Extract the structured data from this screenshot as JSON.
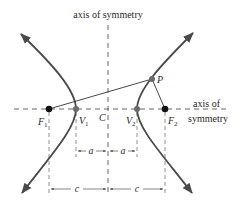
{
  "diagram": {
    "type": "hyperbola",
    "colors": {
      "curve": "#4a4a4a",
      "dashed": "#555555",
      "point_focus": "#111111",
      "point_vertex": "#6a6a6a",
      "text": "#2a2a2a"
    },
    "labels": {
      "vertical_axis": "axis of symmetry",
      "horizontal_axis_line1": "axis of",
      "horizontal_axis_line2": "symmetry",
      "center": "C",
      "point": "P",
      "focus1": "F",
      "focus1_sub": "1",
      "focus2": "F",
      "focus2_sub": "2",
      "vertex1": "V",
      "vertex1_sub": "1",
      "vertex2": "V",
      "vertex2_sub": "2",
      "dim_a_left": "a",
      "dim_a_right": "a",
      "dim_c_left": "c",
      "dim_c_right": "c"
    }
  }
}
